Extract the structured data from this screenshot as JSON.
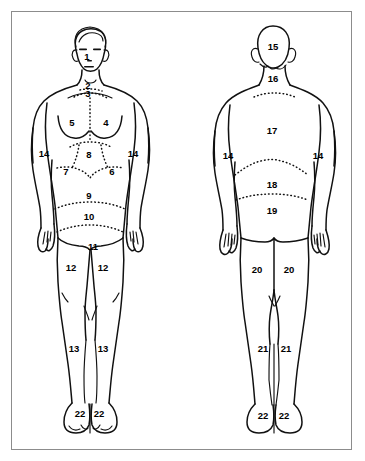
{
  "diagram": {
    "background_color": "#ffffff",
    "stroke_color": "#111111",
    "border_color": "#8c8c8c",
    "figures": [
      {
        "id": "anterior",
        "name": "Front view figure"
      },
      {
        "id": "posterior",
        "name": "Back view figure"
      }
    ],
    "anterior_labels": [
      {
        "text": "1",
        "x": 87,
        "y": 57,
        "region": "face"
      },
      {
        "text": "2",
        "x": 88,
        "y": 86,
        "region": "anterior-neck"
      },
      {
        "text": "3",
        "x": 88,
        "y": 94,
        "region": "suprasternal-notch"
      },
      {
        "text": "5",
        "x": 72,
        "y": 123,
        "region": "right-chest"
      },
      {
        "text": "4",
        "x": 106,
        "y": 123,
        "region": "left-chest"
      },
      {
        "text": "14",
        "x": 44,
        "y": 154,
        "region": "right-arm"
      },
      {
        "text": "14",
        "x": 133,
        "y": 154,
        "region": "left-arm"
      },
      {
        "text": "8",
        "x": 89,
        "y": 155,
        "region": "epigastrium"
      },
      {
        "text": "7",
        "x": 66,
        "y": 172,
        "region": "right-hypochondrium"
      },
      {
        "text": "6",
        "x": 112,
        "y": 172,
        "region": "left-hypochondrium"
      },
      {
        "text": "9",
        "x": 89,
        "y": 196,
        "region": "umbilical"
      },
      {
        "text": "10",
        "x": 89,
        "y": 217,
        "region": "hypogastrium"
      },
      {
        "text": "11",
        "x": 93,
        "y": 247,
        "region": "groin"
      },
      {
        "text": "12",
        "x": 71,
        "y": 268,
        "region": "right-thigh"
      },
      {
        "text": "12",
        "x": 103,
        "y": 268,
        "region": "left-thigh"
      },
      {
        "text": "13",
        "x": 74,
        "y": 349,
        "region": "right-lower-leg"
      },
      {
        "text": "13",
        "x": 103,
        "y": 349,
        "region": "left-lower-leg"
      },
      {
        "text": "22",
        "x": 80,
        "y": 414,
        "region": "right-foot"
      },
      {
        "text": "22",
        "x": 99,
        "y": 414,
        "region": "left-foot"
      }
    ],
    "posterior_labels": [
      {
        "text": "15",
        "x": 273,
        "y": 47,
        "region": "back-of-head"
      },
      {
        "text": "16",
        "x": 273,
        "y": 79,
        "region": "posterior-neck"
      },
      {
        "text": "17",
        "x": 272,
        "y": 131,
        "region": "upper-back"
      },
      {
        "text": "14",
        "x": 228,
        "y": 156,
        "region": "right-arm"
      },
      {
        "text": "14",
        "x": 318,
        "y": 156,
        "region": "left-arm"
      },
      {
        "text": "18",
        "x": 272,
        "y": 185,
        "region": "mid-back"
      },
      {
        "text": "19",
        "x": 272,
        "y": 211,
        "region": "lower-back"
      },
      {
        "text": "20",
        "x": 257,
        "y": 270,
        "region": "right-buttock-thigh"
      },
      {
        "text": "20",
        "x": 289,
        "y": 270,
        "region": "left-buttock-thigh"
      },
      {
        "text": "21",
        "x": 263,
        "y": 349,
        "region": "right-calf"
      },
      {
        "text": "21",
        "x": 286,
        "y": 349,
        "region": "left-calf"
      },
      {
        "text": "22",
        "x": 263,
        "y": 416,
        "region": "right-foot"
      },
      {
        "text": "22",
        "x": 284,
        "y": 416,
        "region": "left-foot"
      }
    ]
  }
}
